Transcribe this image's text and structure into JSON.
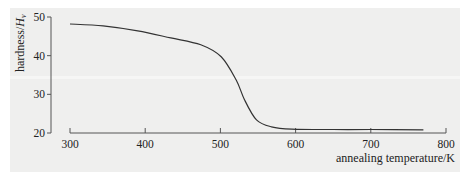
{
  "chart_data": {
    "type": "line",
    "title": "",
    "xlabel": "annealing temperature/K",
    "ylabel": "hardness/H_v",
    "ylabel_main": "hardness/",
    "ylabel_sym": "H",
    "ylabel_sub": "v",
    "xlim": [
      300,
      800
    ],
    "ylim": [
      20,
      50
    ],
    "xticks": [
      300,
      400,
      500,
      600,
      700,
      800
    ],
    "yticks": [
      20,
      30,
      40,
      50
    ],
    "grid": false,
    "legend": null,
    "series": [
      {
        "name": "hardness",
        "x": [
          300,
          344,
          390,
          434,
          474,
          501,
          521,
          532,
          548,
          568,
          595,
          650,
          700,
          770
        ],
        "y": [
          48.2,
          47.7,
          46.4,
          44.6,
          42.8,
          39.7,
          33.7,
          28.6,
          23.4,
          21.6,
          21.0,
          20.9,
          20.9,
          20.8
        ]
      }
    ]
  },
  "colors": {
    "panel": "#efefee",
    "axis": "#555555",
    "line": "#333333",
    "text": "#222222"
  }
}
